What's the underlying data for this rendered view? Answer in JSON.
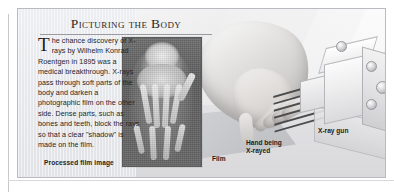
{
  "article": {
    "title": "Picturing the Body",
    "dropcap": "T",
    "body": "he chance discovery of X-rays by Wilhelm Konrad Roentgen in 1895 was a medical breakthrough. X-rays pass through soft parts of the body and darken a photographic film on the other side. Dense parts, such as bones and teeth, block the rays so that a clear \"shadow\" is made on the film.",
    "captions": {
      "processed_film": "Processed film image",
      "film": "Film",
      "hand": "Hand being\nX-rayed",
      "gun": "X-ray gun"
    }
  },
  "figure": {
    "xray_image_alt": "X-ray photograph of a human hand",
    "beam_count": 6
  },
  "colors": {
    "panel_background": "#e8e9ec",
    "panel_border": "#b9bbc0",
    "page_background": "#ffffff",
    "text": "#26262a",
    "film_grey": "#c3c4c8",
    "xray_film": "#5e5e5e",
    "beam": "#4b4b4d"
  }
}
